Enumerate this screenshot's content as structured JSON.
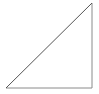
{
  "canvas": {
    "width": 99,
    "height": 94,
    "background_color": "#ffffff"
  },
  "figure": {
    "name": "right-triangle",
    "fill": "none",
    "stroke_width": 1
  },
  "chart_data": {
    "type": "diagram",
    "shape": "right-triangle",
    "title": "",
    "xlabel": "",
    "ylabel": "",
    "grid": false,
    "legend": null,
    "annotations": [],
    "vertices": [
      {
        "name": "bottom-left",
        "x": 6,
        "y": 88
      },
      {
        "name": "bottom-right",
        "x": 92,
        "y": 88
      },
      {
        "name": "top-right",
        "x": 92,
        "y": 3
      }
    ],
    "edges": [
      {
        "name": "base",
        "from": "bottom-left",
        "to": "bottom-right",
        "orientation": "horizontal",
        "color": "#8a8a8a",
        "width": 1,
        "path": "M 6 88 L 92 88"
      },
      {
        "name": "vertical-leg",
        "from": "bottom-right",
        "to": "top-right",
        "orientation": "vertical",
        "color": "#8a8a8a",
        "width": 1,
        "path": "M 92 88 L 92 3"
      },
      {
        "name": "hypotenuse",
        "from": "bottom-left",
        "to": "top-right",
        "orientation": "diagonal",
        "color": "#555555",
        "width": 1,
        "path": "M 6 88 L 92 3"
      }
    ]
  }
}
